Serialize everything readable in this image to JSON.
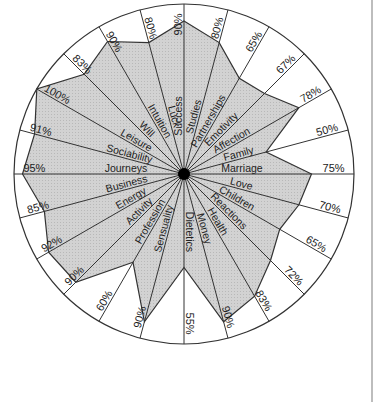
{
  "chart_data": {
    "type": "radar",
    "title": "",
    "axis_direction": "clockwise from top",
    "max_value": 100,
    "unit": "%",
    "categories": [
      "Success",
      "Studies",
      "Partnerships",
      "Emotivity",
      "Affection",
      "Family",
      "Marriage",
      "Love",
      "Children",
      "Reactions",
      "Health",
      "Money",
      "Dietetics",
      "Sensuality",
      "Profession",
      "Activity",
      "Energy",
      "Business",
      "Journeys",
      "Sociability",
      "Leisure",
      "Will",
      "Intuition",
      "Luck"
    ],
    "values": [
      90,
      80,
      65,
      67,
      78,
      50,
      75,
      70,
      65,
      72,
      83,
      90,
      55,
      90,
      60,
      90,
      92,
      85,
      95,
      91,
      100,
      83,
      90,
      80
    ],
    "value_labels": [
      "90%",
      "80%",
      "65%",
      "67%",
      "78%",
      "50%",
      "75%",
      "70%",
      "65%",
      "72%",
      "83%",
      "90%",
      "55%",
      "90%",
      "60%",
      "90%",
      "92%",
      "85%",
      "95%",
      "91%",
      "100%",
      "83%",
      "90%",
      "80%"
    ],
    "colors": {
      "fill": "#cfcfcf",
      "line": "#333333",
      "center": "#000000",
      "background": "#ffffff"
    },
    "grid": true,
    "legend": null
  }
}
